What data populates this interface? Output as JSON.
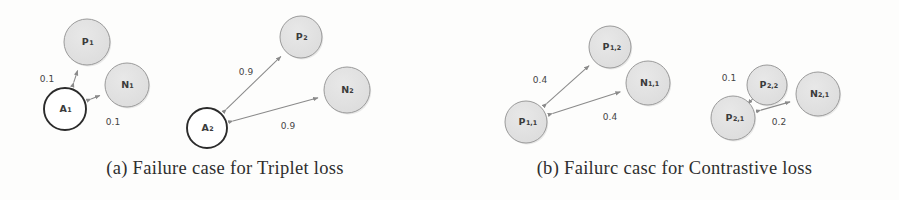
{
  "figure": {
    "width": 899,
    "height": 200,
    "background_color": "#fdfdfc"
  },
  "style": {
    "gray_node_fill": "#dcdcdc",
    "gray_node_stroke": "#9a9a9a",
    "anchor_node_fill": "#ffffff",
    "anchor_node_stroke": "#2b2b2b",
    "edge_color": "#8a8a8a",
    "label_color": "#3b3b3b",
    "caption_color": "#2e2e2e"
  },
  "panels": [
    {
      "id": "panel-a",
      "caption": "(a) Failure case for Triplet loss",
      "nodes": [
        {
          "name": "A1",
          "base": "A",
          "sub": "1",
          "cx": 65,
          "cy": 109,
          "r": 21,
          "kind": "anchor"
        },
        {
          "name": "P1",
          "base": "P",
          "sub": "1",
          "cx": 87,
          "cy": 42,
          "r": 23,
          "kind": "positive"
        },
        {
          "name": "N1",
          "base": "N",
          "sub": "1",
          "cx": 127,
          "cy": 85,
          "r": 22,
          "kind": "negative"
        },
        {
          "name": "A2",
          "base": "A",
          "sub": "2",
          "cx": 207,
          "cy": 128,
          "r": 20,
          "kind": "anchor"
        },
        {
          "name": "P2",
          "base": "P",
          "sub": "2",
          "cx": 301,
          "cy": 37,
          "r": 21,
          "kind": "positive"
        },
        {
          "name": "N2",
          "base": "N",
          "sub": "2",
          "cx": 347,
          "cy": 90,
          "r": 23,
          "kind": "negative"
        }
      ],
      "edges": [
        {
          "from": "A1",
          "to": "P1",
          "label": "0.1",
          "lx": 47,
          "ly": 79
        },
        {
          "from": "A1",
          "to": "N1",
          "label": "0.1",
          "lx": 113,
          "ly": 122
        },
        {
          "from": "A2",
          "to": "P2",
          "label": "0.9",
          "lx": 246,
          "ly": 72
        },
        {
          "from": "A2",
          "to": "N2",
          "label": "0.9",
          "lx": 288,
          "ly": 126
        }
      ]
    },
    {
      "id": "panel-b",
      "caption": "(b) Failurc casc for Contrastive loss",
      "nodes": [
        {
          "name": "P11",
          "base": "P",
          "sub": "1,1",
          "cx": 76,
          "cy": 122,
          "r": 21,
          "kind": "positive"
        },
        {
          "name": "P12",
          "base": "P",
          "sub": "1,2",
          "cx": 160,
          "cy": 47,
          "r": 21,
          "kind": "positive"
        },
        {
          "name": "N11",
          "base": "N",
          "sub": "1,1",
          "cx": 198,
          "cy": 83,
          "r": 22,
          "kind": "negative"
        },
        {
          "name": "P21",
          "base": "P",
          "sub": "2,1",
          "cx": 283,
          "cy": 118,
          "r": 22,
          "kind": "positive"
        },
        {
          "name": "P22",
          "base": "P",
          "sub": "2,2",
          "cx": 317,
          "cy": 85,
          "r": 20,
          "kind": "positive"
        },
        {
          "name": "N21",
          "base": "N",
          "sub": "2,1",
          "cx": 368,
          "cy": 94,
          "r": 22,
          "kind": "negative"
        }
      ],
      "edges": [
        {
          "from": "P11",
          "to": "P12",
          "label": "0.4",
          "lx": 90,
          "ly": 80
        },
        {
          "from": "P11",
          "to": "N11",
          "label": "0.4",
          "lx": 160,
          "ly": 117
        },
        {
          "from": "P21",
          "to": "P22",
          "label": "0.1",
          "lx": 279,
          "ly": 78
        },
        {
          "from": "P21",
          "to": "N21",
          "label": "0.2",
          "lx": 329,
          "ly": 122
        }
      ]
    }
  ]
}
